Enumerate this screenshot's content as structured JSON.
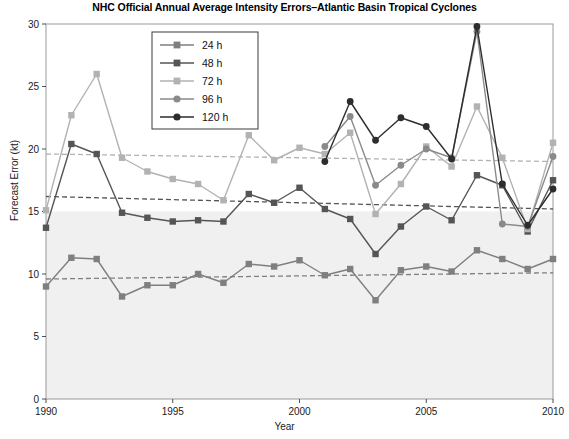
{
  "chart_data": {
    "type": "line",
    "title": "NHC Official Annual Average Intensity Errors–Atlantic Basin Tropical Cyclones",
    "xlabel": "Year",
    "ylabel": "Forecast Error (kt)",
    "xlim": [
      1990,
      2010
    ],
    "ylim": [
      0,
      30
    ],
    "xticks": [
      1990,
      1995,
      2000,
      2005,
      2010
    ],
    "yticks": [
      0,
      5,
      10,
      15,
      20,
      25,
      30
    ],
    "grid": false,
    "legend_position": "upper-left-inside",
    "x": [
      1990,
      1991,
      1992,
      1993,
      1994,
      1995,
      1996,
      1997,
      1998,
      1999,
      2000,
      2001,
      2002,
      2003,
      2004,
      2005,
      2006,
      2007,
      2008,
      2009,
      2010
    ],
    "series": [
      {
        "name": "24 h",
        "label": "24 h",
        "color": "#7f7f7f",
        "marker": "square",
        "values": [
          9.0,
          11.3,
          11.2,
          8.2,
          9.1,
          9.1,
          10.0,
          9.3,
          10.8,
          10.6,
          11.1,
          9.9,
          10.4,
          7.9,
          10.3,
          10.6,
          10.2,
          11.9,
          11.2,
          10.4,
          11.2
        ],
        "trend": {
          "start": 9.6,
          "end": 10.1,
          "style": "dashed",
          "color": "#7f7f7f"
        }
      },
      {
        "name": "48 h",
        "label": "48 h",
        "color": "#555555",
        "marker": "square",
        "values": [
          13.7,
          20.4,
          19.6,
          14.9,
          14.5,
          14.2,
          14.3,
          14.2,
          16.4,
          15.7,
          16.9,
          15.2,
          14.4,
          11.6,
          13.8,
          15.4,
          14.3,
          17.9,
          17.1,
          13.4,
          17.5
        ],
        "trend": {
          "start": 16.2,
          "end": 15.2,
          "style": "dashed",
          "color": "#555555"
        }
      },
      {
        "name": "72 h",
        "label": "72 h",
        "color": "#b2b2b2",
        "marker": "square",
        "values": [
          15.1,
          22.7,
          26.0,
          19.3,
          18.2,
          17.6,
          17.2,
          15.9,
          21.1,
          19.1,
          20.1,
          19.6,
          21.3,
          14.8,
          17.2,
          20.2,
          18.6,
          23.4,
          19.3,
          13.6,
          20.5
        ],
        "trend": {
          "start": 19.6,
          "end": 19.0,
          "style": "dashed",
          "color": "#b2b2b2"
        }
      },
      {
        "name": "96 h",
        "label": "96 h",
        "color": "#8a8a8a",
        "marker": "circle",
        "values": [
          null,
          null,
          null,
          null,
          null,
          null,
          null,
          null,
          null,
          null,
          null,
          20.2,
          22.6,
          17.1,
          18.7,
          20.0,
          19.3,
          29.4,
          14.0,
          13.8,
          19.4
        ]
      },
      {
        "name": "120 h",
        "label": "120 h",
        "color": "#2d2d2d",
        "marker": "circle",
        "values": [
          null,
          null,
          null,
          null,
          null,
          null,
          null,
          null,
          null,
          null,
          null,
          19.0,
          23.8,
          20.7,
          22.5,
          21.8,
          19.2,
          29.8,
          17.2,
          13.9,
          16.8
        ]
      }
    ]
  },
  "legend": {
    "items": [
      {
        "label": "24 h"
      },
      {
        "label": "48 h"
      },
      {
        "label": "72 h"
      },
      {
        "label": "96 h"
      },
      {
        "label": "120 h"
      }
    ]
  },
  "axes": {
    "y_tick_labels": [
      "0",
      "5",
      "10",
      "15",
      "20",
      "25",
      "30"
    ],
    "x_tick_labels": [
      "1990",
      "1995",
      "2000",
      "2005",
      "2010"
    ]
  }
}
